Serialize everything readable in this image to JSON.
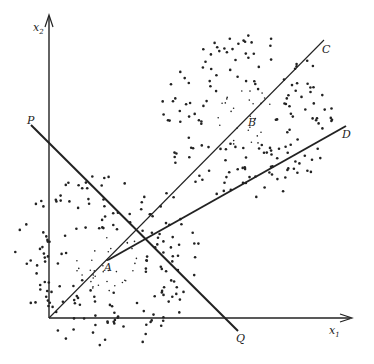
{
  "figure": {
    "axes": {
      "x_label": "x",
      "x_sub": "1",
      "y_label": "x",
      "y_sub": "2",
      "origin": [
        49,
        318
      ],
      "x_end": [
        352,
        318
      ],
      "y_end": [
        49,
        15
      ]
    },
    "points": {
      "A": {
        "label": "A",
        "pos": [
          108,
          260
        ]
      },
      "B": {
        "label": "B",
        "pos": [
          245,
          117
        ]
      }
    },
    "lines": {
      "C": {
        "label": "C",
        "from": [
          49,
          318
        ],
        "to": [
          324,
          40
        ],
        "weight": 1.1
      },
      "D": {
        "label": "D",
        "from": [
          108,
          260
        ],
        "to": [
          346,
          126
        ],
        "weight": 2
      },
      "PQ": {
        "label_start": "P",
        "label_end": "Q",
        "from": [
          31,
          125
        ],
        "to": [
          238,
          331
        ],
        "weight": 2
      }
    },
    "colors": {
      "ink": "#222222",
      "background": "#ffffff"
    }
  }
}
